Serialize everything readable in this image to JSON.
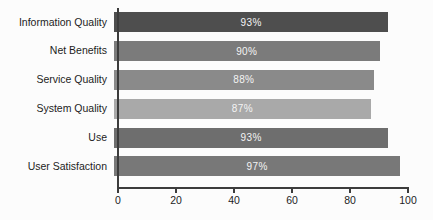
{
  "chart_data": {
    "type": "bar",
    "orientation": "horizontal",
    "title": "",
    "xlabel": "",
    "ylabel": "",
    "categories": [
      "Information Quality",
      "Net Benefits",
      "Service Quality",
      "System Quality",
      "Use",
      "User Satisfaction"
    ],
    "values": [
      93,
      90,
      88,
      87,
      93,
      97
    ],
    "value_labels": [
      "93%",
      "90%",
      "88%",
      "87%",
      "93%",
      "97%"
    ],
    "bar_colors": [
      "#4e4e4e",
      "#7b7b7b",
      "#8a8a8a",
      "#a9a9a9",
      "#6e6e6e",
      "#787878"
    ],
    "xlim": [
      0,
      100
    ],
    "x_ticks": [
      0,
      20,
      40,
      60,
      80,
      100
    ],
    "grid": false,
    "legend": false,
    "value_label_color": "#f4f4f4",
    "axis_color": "#3c3c3c",
    "category_label_color": "#1c1c1c",
    "background_color": "#fcfcfc"
  }
}
